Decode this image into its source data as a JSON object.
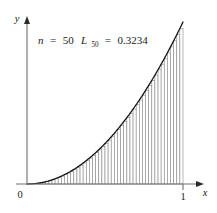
{
  "figure": {
    "name": "riemann-lower-sum-figure",
    "background_color": "#ffffff",
    "curve_color": "#111111",
    "bar_stroke_color": "#8a8a8a",
    "bar_fill_color": "#ffffff",
    "axis_color": "#6e6e6e",
    "text_color": "#1a1a1a"
  },
  "axes": {
    "x_label": "x",
    "y_label": "y",
    "origin_label": "0",
    "x_tick_label": "1",
    "x_tick_value": 1,
    "x_axis_name": "x-axis",
    "y_axis_name": "y-axis"
  },
  "annotation": {
    "n_symbol": "n",
    "n_equals": "=",
    "n_value": "50",
    "L_symbol": "L",
    "L_subscript": "50",
    "L_equals": "=",
    "L_value": "0.3234",
    "full_text": "n = 50    L50 = 0.3234"
  },
  "chart_data": {
    "type": "area",
    "title": "",
    "subtitle": "",
    "xlabel": "x",
    "ylabel": "y",
    "grid": false,
    "legend": "none",
    "xlim": [
      0,
      1
    ],
    "ylim": [
      0,
      1
    ],
    "function": "y = x^2",
    "n_rectangles": 50,
    "sum_type": "lower (left-endpoint) Riemann sum",
    "sum_symbol": "L_50",
    "sum_value": 0.3234,
    "exact_integral": 0.3333,
    "annotations": [
      "n = 50",
      "L50 = 0.3234"
    ],
    "x_tick_values": [
      0,
      1
    ],
    "x_tick_labels": [
      "0",
      "1"
    ],
    "y_tick_values": [],
    "y_tick_labels": [],
    "curve_x": [
      0,
      0.05,
      0.1,
      0.15,
      0.2,
      0.25,
      0.3,
      0.35,
      0.4,
      0.45,
      0.5,
      0.55,
      0.6,
      0.65,
      0.7,
      0.75,
      0.8,
      0.85,
      0.9,
      0.95,
      1
    ],
    "curve_y": [
      0,
      0.0025,
      0.01,
      0.0225,
      0.04,
      0.0625,
      0.09,
      0.1225,
      0.16,
      0.2025,
      0.25,
      0.3025,
      0.36,
      0.4225,
      0.49,
      0.5625,
      0.64,
      0.7225,
      0.81,
      0.9025,
      1
    ],
    "bar_left_edges": [
      0,
      0.02,
      0.04,
      0.06,
      0.08,
      0.1,
      0.12,
      0.14,
      0.16,
      0.18,
      0.2,
      0.22,
      0.24,
      0.26,
      0.28,
      0.3,
      0.32,
      0.34,
      0.36,
      0.38,
      0.4,
      0.42,
      0.44,
      0.46,
      0.48,
      0.5,
      0.52,
      0.54,
      0.56,
      0.58,
      0.6,
      0.62,
      0.64,
      0.66,
      0.68,
      0.7,
      0.72,
      0.74,
      0.76,
      0.78,
      0.8,
      0.82,
      0.84,
      0.86,
      0.88,
      0.9,
      0.92,
      0.94,
      0.96,
      0.98
    ],
    "bar_heights": [
      0,
      0.0004,
      0.0016,
      0.0036,
      0.0064,
      0.01,
      0.0144,
      0.0196,
      0.0256,
      0.0324,
      0.04,
      0.0484,
      0.0576,
      0.0676,
      0.0784,
      0.09,
      0.1024,
      0.1156,
      0.1296,
      0.1444,
      0.16,
      0.1764,
      0.1936,
      0.2116,
      0.2304,
      0.25,
      0.2704,
      0.2916,
      0.3136,
      0.3364,
      0.36,
      0.3844,
      0.4096,
      0.4356,
      0.4624,
      0.49,
      0.5184,
      0.5476,
      0.5776,
      0.6084,
      0.64,
      0.6724,
      0.7056,
      0.7396,
      0.7744,
      0.81,
      0.8464,
      0.8836,
      0.9216,
      0.9604
    ],
    "bar_width": 0.02
  },
  "geometry": {
    "origin_px": {
      "x": 27,
      "y": 184
    },
    "x_one_px": 183,
    "y_top_px": 22,
    "x_axis_end_px": 203,
    "y_axis_top_px": 18
  }
}
